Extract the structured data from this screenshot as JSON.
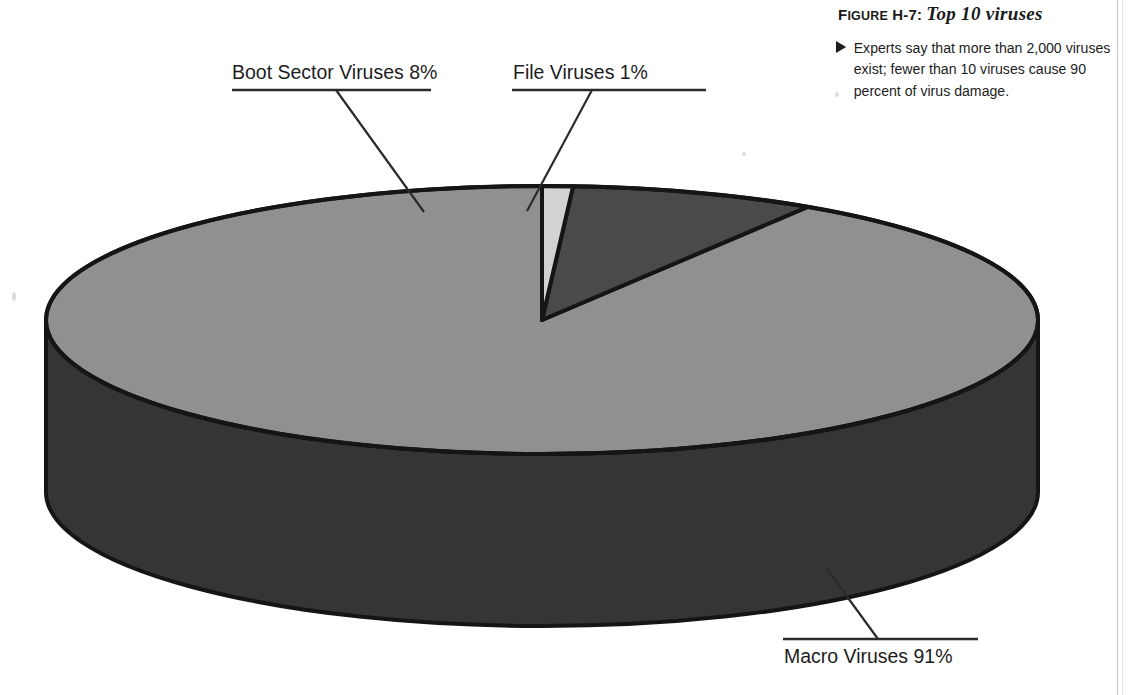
{
  "figure": {
    "label_prefix": "F",
    "label_rest": "IGURE",
    "label_number": " H-7:",
    "title": "Top 10 viruses",
    "caption": "Experts say that more than 2,000 viruses exist; fewer than 10 viruses cause 90 percent of virus damage.",
    "bullet_icon": "triangle-right-icon"
  },
  "chart_data": {
    "type": "pie",
    "title": "Top 10 viruses",
    "style": "3d-cylinder",
    "categories": [
      "Macro Viruses",
      "Boot Sector Viruses",
      "File Viruses"
    ],
    "values": [
      91,
      8,
      1
    ],
    "value_suffix": "%",
    "labels": [
      "Macro Viruses 91%",
      "Boot Sector Viruses 8%",
      "File Viruses 1%"
    ],
    "colors": [
      "#909090",
      "#4a4a4a",
      "#d2d2d2"
    ],
    "side_colors": [
      "#353535",
      "#353535",
      "#353535"
    ],
    "outline_color": "#151515",
    "legend": "none",
    "grid": false,
    "start_angle_deg": 0,
    "rotation": "clockwise-from-12-oclock",
    "geometry": {
      "cx": 542,
      "cy": 320,
      "rx": 496,
      "ry": 134,
      "depth": 172
    },
    "slices": [
      {
        "name": "Macro Viruses",
        "value": 91,
        "label": "Macro Viruses 91%",
        "color": "#909090",
        "start_deg": 32.4,
        "end_deg": 360.0
      },
      {
        "name": "Boot Sector Viruses",
        "value": 8,
        "label": "Boot Sector Viruses 8%",
        "color": "#4a4a4a",
        "start_deg": 3.6,
        "end_deg": 32.4
      },
      {
        "name": "File Viruses",
        "value": 1,
        "label": "File Viruses 1%",
        "color": "#d2d2d2",
        "start_deg": 0.0,
        "end_deg": 3.6
      }
    ]
  },
  "callouts": {
    "boot": {
      "text": "Boot Sector Viruses 8%",
      "underline": {
        "x1": 232,
        "y1": 90,
        "x2": 431,
        "y2": 90
      },
      "leader": {
        "x1": 336,
        "y1": 90,
        "x2": 424,
        "y2": 212
      }
    },
    "file": {
      "text": "File Viruses 1%",
      "underline": {
        "x1": 512,
        "y1": 90,
        "x2": 706,
        "y2": 90
      },
      "leader": {
        "x1": 592,
        "y1": 90,
        "x2": 527,
        "y2": 211
      }
    },
    "macro": {
      "text": "Macro Viruses 91%",
      "underline": {
        "x1": 783,
        "y1": 639,
        "x2": 978,
        "y2": 639
      },
      "leader": {
        "x1": 827,
        "y1": 569,
        "x2": 878,
        "y2": 639
      }
    }
  }
}
